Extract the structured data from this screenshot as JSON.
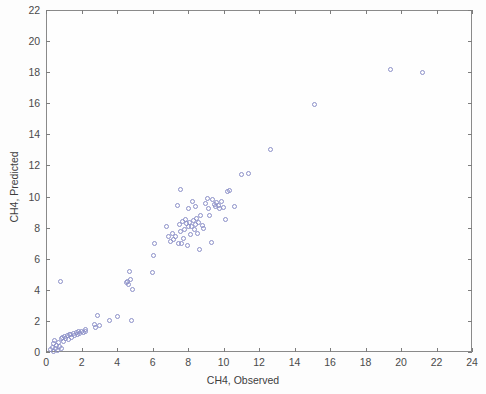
{
  "chart_data": {
    "type": "scatter",
    "title": "",
    "xlabel": "CH4, Observed",
    "ylabel": "CH4, Predicted",
    "xlim": [
      0,
      24
    ],
    "ylim": [
      0,
      22
    ],
    "xticks": [
      0,
      2,
      4,
      6,
      8,
      10,
      12,
      14,
      16,
      18,
      20,
      22,
      24
    ],
    "yticks": [
      0,
      2,
      4,
      6,
      8,
      10,
      12,
      14,
      16,
      18,
      20,
      22
    ],
    "xtick_labels": [
      "0",
      "2",
      "4",
      "6",
      "8",
      "10",
      "12",
      "14",
      "16",
      "18",
      "20",
      "22",
      "24"
    ],
    "ytick_labels": [
      "0",
      "2",
      "4",
      "6",
      "8",
      "10",
      "12",
      "14",
      "16",
      "18",
      "20",
      "22"
    ],
    "grid": false,
    "legend": null,
    "marker": {
      "style": "open-circle",
      "edge_color": "#8c90c8",
      "fill_color": "none",
      "size_px": 5
    },
    "axis_color": "#8a8a8a",
    "background_color": "#fdfdfd",
    "series": [
      {
        "name": "CH4 Predicted vs Observed",
        "points": [
          [
            0.25,
            0.15
          ],
          [
            0.35,
            0.3
          ],
          [
            0.4,
            0.05
          ],
          [
            0.45,
            0.55
          ],
          [
            0.5,
            0.75
          ],
          [
            0.55,
            0.25
          ],
          [
            0.6,
            0.4
          ],
          [
            0.65,
            0.12
          ],
          [
            0.7,
            0.62
          ],
          [
            0.75,
            0.35
          ],
          [
            0.8,
            4.55
          ],
          [
            0.85,
            0.2
          ],
          [
            0.9,
            0.85
          ],
          [
            0.95,
            0.95
          ],
          [
            1.0,
            0.7
          ],
          [
            1.05,
            1.0
          ],
          [
            1.1,
            0.9
          ],
          [
            1.2,
            1.05
          ],
          [
            1.25,
            0.8
          ],
          [
            1.3,
            1.1
          ],
          [
            1.4,
            1.15
          ],
          [
            1.45,
            0.95
          ],
          [
            1.55,
            1.2
          ],
          [
            1.6,
            1.05
          ],
          [
            1.7,
            1.25
          ],
          [
            1.75,
            1.15
          ],
          [
            1.85,
            1.3
          ],
          [
            1.9,
            1.2
          ],
          [
            2.0,
            1.35
          ],
          [
            2.1,
            1.25
          ],
          [
            2.2,
            1.45
          ],
          [
            2.25,
            1.3
          ],
          [
            2.75,
            1.75
          ],
          [
            2.8,
            1.6
          ],
          [
            2.9,
            2.35
          ],
          [
            3.0,
            1.7
          ],
          [
            3.6,
            2.05
          ],
          [
            4.0,
            2.3
          ],
          [
            4.55,
            4.45
          ],
          [
            4.6,
            4.55
          ],
          [
            4.65,
            4.35
          ],
          [
            4.7,
            5.15
          ],
          [
            4.75,
            4.65
          ],
          [
            4.8,
            2.05
          ],
          [
            4.85,
            4.05
          ],
          [
            6.0,
            5.1
          ],
          [
            6.05,
            6.2
          ],
          [
            6.1,
            6.95
          ],
          [
            6.8,
            8.1
          ],
          [
            6.9,
            7.45
          ],
          [
            7.0,
            7.1
          ],
          [
            7.1,
            7.6
          ],
          [
            7.2,
            7.25
          ],
          [
            7.3,
            7.4
          ],
          [
            7.4,
            9.45
          ],
          [
            7.45,
            7.0
          ],
          [
            7.5,
            8.2
          ],
          [
            7.55,
            7.75
          ],
          [
            7.6,
            10.45
          ],
          [
            7.65,
            6.95
          ],
          [
            7.7,
            8.4
          ],
          [
            7.75,
            7.3
          ],
          [
            7.8,
            7.85
          ],
          [
            7.85,
            8.55
          ],
          [
            7.9,
            8.25
          ],
          [
            7.95,
            6.85
          ],
          [
            8.0,
            8.1
          ],
          [
            8.05,
            9.2
          ],
          [
            8.1,
            8.35
          ],
          [
            8.15,
            7.55
          ],
          [
            8.2,
            8.05
          ],
          [
            8.25,
            9.7
          ],
          [
            8.3,
            8.45
          ],
          [
            8.35,
            7.9
          ],
          [
            8.4,
            8.2
          ],
          [
            8.45,
            9.35
          ],
          [
            8.5,
            8.6
          ],
          [
            8.55,
            7.65
          ],
          [
            8.6,
            8.3
          ],
          [
            8.65,
            6.6
          ],
          [
            8.7,
            8.75
          ],
          [
            8.8,
            8.15
          ],
          [
            8.9,
            7.95
          ],
          [
            9.0,
            9.55
          ],
          [
            9.1,
            9.9
          ],
          [
            9.15,
            9.25
          ],
          [
            9.2,
            8.75
          ],
          [
            9.3,
            7.05
          ],
          [
            9.4,
            9.8
          ],
          [
            9.5,
            9.5
          ],
          [
            9.55,
            9.35
          ],
          [
            9.6,
            9.6
          ],
          [
            9.7,
            9.45
          ],
          [
            9.8,
            9.2
          ],
          [
            9.9,
            9.65
          ],
          [
            10.0,
            9.3
          ],
          [
            10.1,
            8.55
          ],
          [
            10.2,
            10.3
          ],
          [
            10.35,
            10.4
          ],
          [
            10.6,
            9.35
          ],
          [
            11.0,
            11.4
          ],
          [
            11.4,
            11.5
          ],
          [
            12.65,
            13.05
          ],
          [
            15.1,
            15.9
          ],
          [
            19.4,
            18.2
          ],
          [
            21.2,
            18.0
          ]
        ]
      }
    ]
  }
}
